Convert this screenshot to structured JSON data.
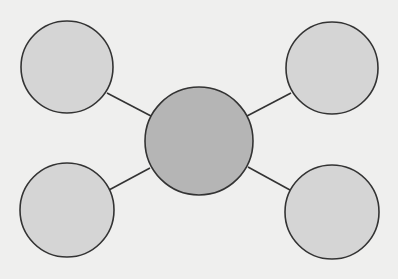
{
  "diagram": {
    "type": "hub-and-spoke",
    "background": "#efefee",
    "stroke": "#333333",
    "hub": {
      "cx": 199,
      "cy": 141,
      "r": 54,
      "fill": "#b5b5b5",
      "label": ""
    },
    "nodes": [
      {
        "id": "top-left",
        "cx": 67,
        "cy": 67,
        "r": 46,
        "fill": "#d5d5d5",
        "label": ""
      },
      {
        "id": "top-right",
        "cx": 332,
        "cy": 68,
        "r": 46,
        "fill": "#d5d5d5",
        "label": ""
      },
      {
        "id": "bottom-left",
        "cx": 67,
        "cy": 210,
        "r": 47,
        "fill": "#d5d5d5",
        "label": ""
      },
      {
        "id": "bottom-right",
        "cx": 332,
        "cy": 212,
        "r": 47,
        "fill": "#d5d5d5",
        "label": ""
      }
    ],
    "connectors": [
      {
        "id": "hub-top-left",
        "x1": 107,
        "y1": 93,
        "x2": 151,
        "y2": 116
      },
      {
        "id": "hub-top-right",
        "x1": 291,
        "y1": 93,
        "x2": 247,
        "y2": 116
      },
      {
        "id": "hub-bottom-left",
        "x1": 109,
        "y1": 190,
        "x2": 150,
        "y2": 168
      },
      {
        "id": "hub-bottom-right",
        "x1": 290,
        "y1": 190,
        "x2": 248,
        "y2": 167
      }
    ]
  }
}
